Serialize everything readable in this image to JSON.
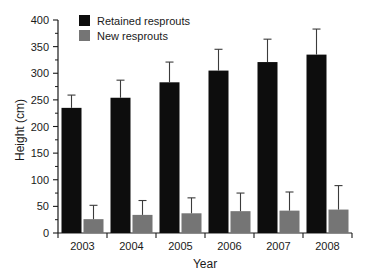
{
  "chart_data": {
    "type": "bar",
    "title": "",
    "xlabel": "Year",
    "ylabel": "Height (cm)",
    "categories": [
      "2003",
      "2004",
      "2005",
      "2006",
      "2007",
      "2008"
    ],
    "ylim": [
      0,
      400
    ],
    "ytick_step": 50,
    "yticks": [
      0,
      50,
      100,
      150,
      200,
      250,
      300,
      350,
      400
    ],
    "ytick_labels": [
      "0",
      "50",
      "100",
      "150",
      "200",
      "250",
      "300",
      "350",
      "400"
    ],
    "minor_ticks": true,
    "grid": false,
    "legend_position": "top-left-inside",
    "series": [
      {
        "name": "Retained resprouts",
        "color": "#0d0d0d",
        "values": [
          235,
          254,
          283,
          305,
          321,
          335
        ],
        "errors": [
          24,
          33,
          38,
          40,
          43,
          48
        ]
      },
      {
        "name": "New resprouts",
        "color": "#757575",
        "values": [
          26,
          34,
          37,
          41,
          42,
          44
        ],
        "errors": [
          26,
          27,
          29,
          34,
          35,
          45
        ]
      }
    ]
  },
  "axes": {
    "y_title": "Height (cm)",
    "x_title": "Year"
  },
  "legend": {
    "items": [
      {
        "label": "Retained resprouts",
        "color": "#0d0d0d"
      },
      {
        "label": "New resprouts",
        "color": "#757575"
      }
    ]
  }
}
